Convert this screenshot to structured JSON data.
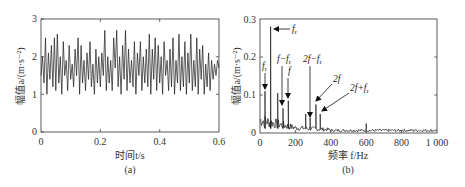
{
  "chart_data": [
    {
      "panel": "(a)",
      "type": "line",
      "title": "",
      "xlabel": "时间t/s",
      "ylabel": "幅值a/(m·s⁻²)",
      "xlim": [
        0,
        0.6
      ],
      "ylim": [
        0,
        3
      ],
      "xticks": [
        "0",
        "0.2",
        "0.4",
        "0.6"
      ],
      "yticks": [
        "0",
        "1",
        "2",
        "3"
      ],
      "grid": false,
      "description": "Time-domain vibration acceleration signal oscillating roughly between 0.9 and 2.7 m·s⁻², mean ≈ 1.7",
      "series": [
        {
          "name": "acceleration",
          "x": [
            0,
            0.005,
            0.01,
            0.015,
            0.02,
            0.025,
            0.03,
            0.035,
            0.04,
            0.045,
            0.05,
            0.055,
            0.06,
            0.065,
            0.07,
            0.075,
            0.08,
            0.085,
            0.09,
            0.095,
            0.1,
            0.105,
            0.11,
            0.115,
            0.12,
            0.125,
            0.13,
            0.135,
            0.14,
            0.145,
            0.15,
            0.155,
            0.16,
            0.165,
            0.17,
            0.175,
            0.18,
            0.185,
            0.19,
            0.195,
            0.2,
            0.205,
            0.21,
            0.215,
            0.22,
            0.225,
            0.23,
            0.235,
            0.24,
            0.245,
            0.25,
            0.255,
            0.26,
            0.265,
            0.27,
            0.275,
            0.28,
            0.285,
            0.29,
            0.295,
            0.3,
            0.305,
            0.31,
            0.315,
            0.32,
            0.325,
            0.33,
            0.335,
            0.34,
            0.345,
            0.35,
            0.355,
            0.36,
            0.365,
            0.37,
            0.375,
            0.38,
            0.385,
            0.39,
            0.395,
            0.4,
            0.405,
            0.41,
            0.415,
            0.42,
            0.425,
            0.43,
            0.435,
            0.44,
            0.445,
            0.45,
            0.455,
            0.46,
            0.465,
            0.47,
            0.475,
            0.48,
            0.485,
            0.49,
            0.495,
            0.5,
            0.505,
            0.51,
            0.515,
            0.52,
            0.525,
            0.53,
            0.535,
            0.54,
            0.545,
            0.55,
            0.555,
            0.56,
            0.565,
            0.57,
            0.575,
            0.58,
            0.585,
            0.59,
            0.595,
            0.6
          ],
          "values": [
            1.5,
            2.0,
            1.3,
            2.5,
            1.0,
            2.1,
            1.4,
            2.3,
            1.2,
            2.5,
            1.1,
            2.6,
            1.3,
            2.0,
            1.0,
            2.4,
            1.5,
            1.9,
            1.1,
            2.3,
            1.4,
            1.8,
            1.2,
            2.2,
            1.5,
            2.5,
            1.0,
            2.3,
            1.3,
            1.9,
            1.1,
            2.1,
            1.4,
            2.4,
            1.2,
            1.8,
            1.0,
            2.2,
            1.3,
            2.0,
            1.2,
            2.1,
            1.5,
            2.7,
            1.1,
            2.0,
            1.3,
            1.9,
            1.1,
            2.5,
            1.7,
            2.7,
            1.2,
            2.0,
            1.0,
            2.3,
            1.4,
            2.7,
            1.1,
            2.2,
            1.3,
            1.9,
            1.2,
            2.4,
            1.0,
            2.1,
            1.5,
            2.4,
            1.1,
            2.0,
            1.3,
            2.2,
            1.2,
            2.6,
            1.0,
            2.2,
            1.4,
            2.5,
            1.1,
            2.3,
            1.3,
            2.0,
            1.0,
            2.4,
            1.5,
            1.9,
            1.1,
            2.2,
            1.2,
            2.5,
            1.0,
            1.9,
            1.3,
            2.6,
            1.1,
            2.0,
            1.2,
            2.4,
            1.0,
            2.1,
            1.3,
            2.6,
            1.1,
            1.9,
            1.2,
            2.5,
            1.0,
            2.2,
            1.4,
            2.3,
            1.0,
            1.8,
            1.2,
            2.1,
            1.1,
            1.9,
            1.4,
            1.8,
            1.5,
            1.9,
            1.7
          ]
        }
      ]
    },
    {
      "panel": "(b)",
      "type": "line",
      "title": "",
      "xlabel": "频率 f/Hz",
      "ylabel": "幅值a/(m·s⁻²)",
      "xlim": [
        0,
        1000
      ],
      "ylim": [
        0,
        0.3
      ],
      "xticks": [
        "0",
        "200",
        "400",
        "600",
        "800",
        "1 000"
      ],
      "yticks": [
        "0",
        "0.1",
        "0.2",
        "0.3"
      ],
      "grid": false,
      "description": "Frequency spectrum with dominant peak at f_r (~60 Hz, 0.28) and labeled harmonics",
      "peaks": [
        {
          "label": "f_r",
          "x": 28,
          "y": 0.11
        },
        {
          "label": "f_r",
          "x": 60,
          "y": 0.28,
          "arrow": "left"
        },
        {
          "label": "",
          "x": 100,
          "y": 0.105
        },
        {
          "label": "f−f_r",
          "x": 130,
          "y": 0.065
        },
        {
          "label": "f",
          "x": 160,
          "y": 0.085
        },
        {
          "label": "",
          "x": 258,
          "y": 0.05
        },
        {
          "label": "2f−f_r",
          "x": 283,
          "y": 0.04
        },
        {
          "label": "2f",
          "x": 316,
          "y": 0.075
        },
        {
          "label": "2f+f_r",
          "x": 340,
          "y": 0.05
        },
        {
          "label": "",
          "x": 600,
          "y": 0.025
        }
      ],
      "noise_floor": 0.01,
      "annotations": [
        "f_r",
        "f_r",
        "f−f_r",
        "f",
        "2f−f_r",
        "2f",
        "2f+f_r"
      ]
    }
  ],
  "panels": {
    "a": {
      "caption": "(a)",
      "xlabel": "时间t/s",
      "ylabel": "幅值a/(m·s⁻²)",
      "xticks": [
        "0",
        "0.2",
        "0.4",
        "0.6"
      ],
      "yticks": [
        "0",
        "1",
        "2",
        "3"
      ]
    },
    "b": {
      "caption": "(b)",
      "xlabel": "频率 f/Hz",
      "ylabel": "幅值a/(m·s⁻²)",
      "xticks": [
        "0",
        "200",
        "400",
        "600",
        "800",
        "1 000"
      ],
      "yticks": [
        "0",
        "0.1",
        "0.2",
        "0.3"
      ],
      "annotations": {
        "fr_top": "f",
        "fr_top_sub": "r",
        "fr_left": "f",
        "fr_left_sub": "r",
        "f_minus_fr": "f−f",
        "f_minus_fr_sub": "r",
        "f": "f",
        "two_f_minus_fr": "2f−f",
        "two_f_minus_fr_sub": "r",
        "two_f": "2f",
        "two_f_plus_fr": "2f+f",
        "two_f_plus_fr_sub": "r"
      }
    }
  }
}
